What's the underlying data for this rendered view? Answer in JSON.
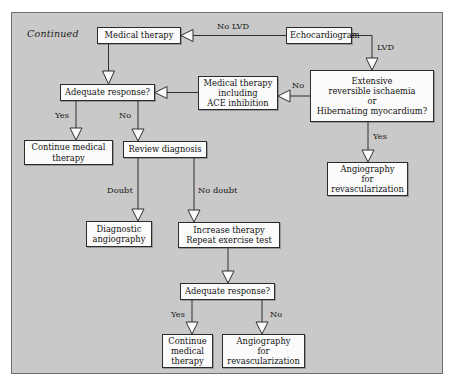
{
  "figure": {
    "continued_label": "Continued",
    "background_color": "#c9c9c9",
    "frame_border_color": "#6f6f6f",
    "node_fill_color": "#fbfbfb",
    "node_border_color": "#2b2b2b",
    "type": "flowchart"
  },
  "nodes": [
    {
      "id": "medical-therapy",
      "label": "Medical therapy"
    },
    {
      "id": "echocardiogram",
      "label": "Echocardiogram"
    },
    {
      "id": "extensive-ischaemia",
      "label": "Extensive\nreversible ischaemia\nor\nHibernating myocardium?"
    },
    {
      "id": "medical-therapy-ace",
      "label": "Medical therapy\nincluding\nACE inhibition"
    },
    {
      "id": "adequate-response-1",
      "label": "Adequate response?"
    },
    {
      "id": "continue-medical-1",
      "label": "Continue medical\ntherapy"
    },
    {
      "id": "review-diagnosis",
      "label": "Review diagnosis"
    },
    {
      "id": "angiography-revasc-1",
      "label": "Angiography\nfor\nrevascularization"
    },
    {
      "id": "diagnostic-angiography",
      "label": "Diagnostic\nangiography"
    },
    {
      "id": "increase-therapy",
      "label": "Increase therapy\nRepeat exercise test"
    },
    {
      "id": "adequate-response-2",
      "label": "Adequate response?"
    },
    {
      "id": "continue-medical-2",
      "label": "Continue\nmedical\ntherapy"
    },
    {
      "id": "angiography-revasc-2",
      "label": "Angiography\nfor\nrevascularization"
    }
  ],
  "edge_labels": {
    "no_lvd": "No LVD",
    "lvd": "LVD",
    "no_ischaemia": "No",
    "yes_ischaemia": "Yes",
    "yes_response_1": "Yes",
    "no_response_1": "No",
    "doubt": "Doubt",
    "no_doubt": "No doubt",
    "yes_response_2": "Yes",
    "no_response_2": "No"
  }
}
